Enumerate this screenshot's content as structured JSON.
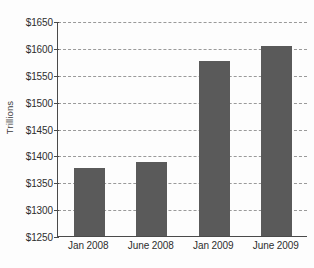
{
  "chart_data": {
    "type": "bar",
    "title": "",
    "subtitle": "",
    "xlabel": "",
    "ylabel": "Trillions",
    "categories": [
      "Jan 2008",
      "June 2008",
      "Jan 2009",
      "June 2009"
    ],
    "values": [
      1377,
      1388,
      1575,
      1603
    ],
    "series": [
      {
        "name": "Trillions",
        "values": [
          1377,
          1388,
          1575,
          1603
        ]
      }
    ],
    "ylim": [
      1250,
      1650
    ],
    "ytick_values": [
      1250,
      1300,
      1350,
      1400,
      1450,
      1500,
      1550,
      1600,
      1650
    ],
    "ytick_labels": [
      "$1250",
      "$1300",
      "$1350",
      "$1400",
      "$1450",
      "$1500",
      "$1550",
      "$1600",
      "$1650"
    ],
    "grid": true,
    "grid_axis": "y",
    "grid_style": "dashed",
    "legend": false,
    "legend_position": "none",
    "bar_color": "#5a5a5a",
    "axis_color": "#4a4a4a",
    "gridline_color": "#9a9a9a",
    "background_color": "#fdfdfd",
    "annotations": []
  }
}
